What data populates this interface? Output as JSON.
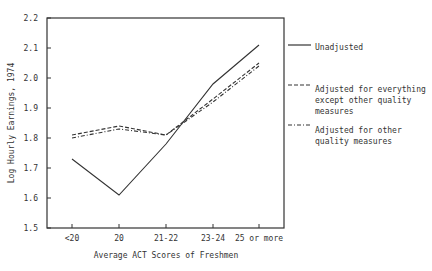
{
  "chart_data": {
    "type": "line",
    "title": "",
    "xlabel": "Average ACT Scores of Freshmen",
    "ylabel": "Log Hourly Earnings, 1974",
    "categories": [
      "<20",
      "20",
      "21-22",
      "23-24",
      "25 or more"
    ],
    "ylim": [
      1.5,
      2.2
    ],
    "yticks": [
      "1.5",
      "1.6",
      "1.7",
      "1.8",
      "1.9",
      "2.0",
      "2.1",
      "2.2"
    ],
    "grid": false,
    "legend_position": "right",
    "series": [
      {
        "name": "Unadjusted",
        "style": "solid",
        "values": [
          1.73,
          1.61,
          1.78,
          1.98,
          2.11
        ]
      },
      {
        "name": "Adjusted for everything except other quality measures",
        "style": "dashed",
        "values": [
          1.81,
          1.84,
          1.81,
          1.93,
          2.05
        ]
      },
      {
        "name": "Adjusted for other quality measures",
        "style": "dash-dot",
        "values": [
          1.8,
          1.83,
          1.81,
          1.92,
          2.04
        ]
      }
    ]
  },
  "legend": {
    "unadjusted": [
      "Unadjusted"
    ],
    "adjusted_everything": [
      "Adjusted for everything",
      "except other quality",
      "measures"
    ],
    "adjusted_quality": [
      "Adjusted for other",
      "quality measures"
    ]
  }
}
